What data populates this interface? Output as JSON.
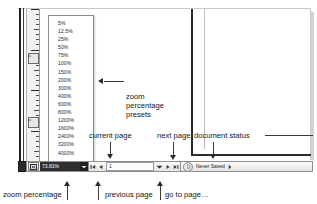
{
  "window": {
    "title": "Document window status bar",
    "ruler": {
      "labels": [
        "0",
        "0"
      ],
      "unit_marks": 30
    }
  },
  "zoom_preset_menu": {
    "name": "zoom percentage presets",
    "items": [
      "5%",
      "12.5%",
      "25%",
      "50%",
      "75%",
      "100%",
      "150%",
      "200%",
      "300%",
      "400%",
      "600%",
      "800%",
      "1200%",
      "1600%",
      "2400%",
      "3200%",
      "4000%"
    ]
  },
  "status_bar": {
    "zoom_percentage": {
      "value": "73.81%",
      "placeholder": "100%",
      "fit_icon": "fit-page-icon",
      "dropdown_icon": "chevron-down-icon"
    },
    "page_nav": {
      "first_page_icon": "first-page-icon",
      "previous_page_icon": "previous-page-icon",
      "current_page_value": "1",
      "current_page_placeholder": "1",
      "goto_page_icon": "chevron-down-icon",
      "next_page_icon": "next-page-icon",
      "last_page_icon": "last-page-icon"
    },
    "document_status": {
      "icon": "document-status-icon",
      "text": "Never Saved",
      "overflow_icon": "chevron-right-icon"
    }
  },
  "callouts": {
    "zoom_presets": "zoom\npercentage\npresets",
    "current_page": "current page",
    "next_page": "next page",
    "document_status": "document status",
    "zoom_percentage": "zoom percentage",
    "previous_page": "previous page",
    "goto_page": "go to page…"
  },
  "colors": {
    "text": "#141414",
    "leader": "#3a3a3a",
    "chrome_dark": "#2b2b2b",
    "field_selected_bg": "#2f2f2f",
    "field_selected_fg": "#ffffff"
  }
}
